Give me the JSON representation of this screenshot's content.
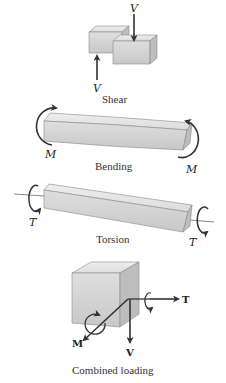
{
  "figure": {
    "panels": [
      {
        "id": "shear",
        "caption": "Shear",
        "labels": {
          "top": "V",
          "bottom": "V"
        }
      },
      {
        "id": "bending",
        "caption": "Bending",
        "labels": {
          "left": "M",
          "right": "M"
        }
      },
      {
        "id": "torsion",
        "caption": "Torsion",
        "labels": {
          "left": "T",
          "right": "T"
        }
      },
      {
        "id": "combined",
        "caption": "Combined loading",
        "labels": {
          "moment": "M",
          "shear": "V",
          "torque": "T"
        }
      }
    ],
    "colors": {
      "block_top": "#e6e6e6",
      "block_front": "#d4d4d4",
      "block_side": "#bdbdbd",
      "edge": "#8a8a8a",
      "arrow": "#333333"
    }
  }
}
